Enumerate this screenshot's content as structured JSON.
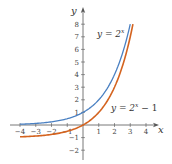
{
  "chart_data": {
    "type": "line",
    "title": "",
    "xlabel": "x",
    "ylabel": "y",
    "xlim": [
      -4,
      4
    ],
    "ylim": [
      -2,
      8
    ],
    "x_ticks": [
      -4,
      -3,
      -2,
      -1,
      1,
      2,
      3,
      4
    ],
    "y_ticks": [
      -2,
      -1,
      1,
      2,
      3,
      4,
      5,
      6,
      7,
      8
    ],
    "x_tick_labels": [
      "−4",
      "−3",
      "−2",
      "−1",
      "1",
      "2",
      "3",
      "4"
    ],
    "y_tick_labels": [
      "−2",
      "−1",
      "1",
      "2",
      "3",
      "4",
      "5",
      "6",
      "7",
      "8"
    ],
    "grid": false,
    "series": [
      {
        "name": "y = 2^x",
        "label_main": "y = 2",
        "label_sup": "x",
        "label_tail": "",
        "color": "#4a80c2",
        "x": [
          -4,
          -3,
          -2,
          -1,
          0,
          1,
          2,
          3
        ],
        "values": [
          0.0625,
          0.125,
          0.25,
          0.5,
          1,
          2,
          4,
          8
        ]
      },
      {
        "name": "y = 2^x − 1",
        "label_main": "y = 2",
        "label_sup": "x",
        "label_tail": " − 1",
        "color": "#d4631f",
        "x": [
          -4,
          -3,
          -2,
          -1,
          0,
          1,
          2,
          3
        ],
        "values": [
          -0.9375,
          -0.875,
          -0.75,
          -0.5,
          0,
          1,
          3,
          7
        ]
      }
    ]
  },
  "axes": {
    "x_label": "x",
    "y_label": "y"
  },
  "labels": {
    "top_main": "y = 2",
    "top_sup": "x",
    "bottom_main": "y = 2",
    "bottom_sup": "x",
    "bottom_tail": " − 1"
  }
}
